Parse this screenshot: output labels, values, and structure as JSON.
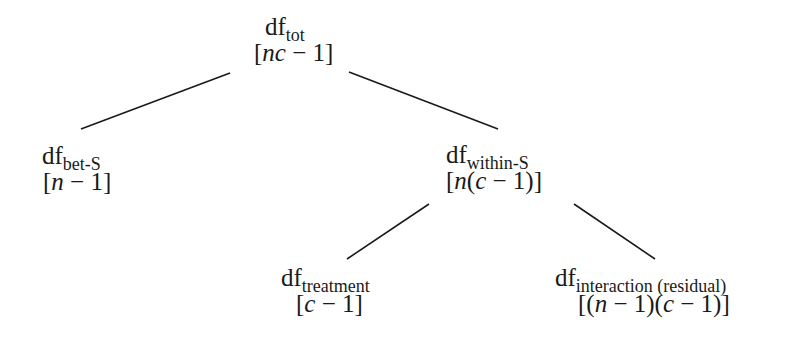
{
  "diagram": {
    "type": "tree",
    "nodes": {
      "total": {
        "base": "df",
        "subscript": "tot",
        "formula_parts": [
          "[",
          "nc",
          " − 1]"
        ]
      },
      "between_subjects": {
        "base": "df",
        "subscript": "bet-S",
        "formula_parts": [
          "[",
          "n",
          " − 1]"
        ]
      },
      "within_subjects": {
        "base": "df",
        "subscript": "within-S",
        "formula_parts": [
          "[",
          "n",
          "(",
          "c",
          " − 1)]"
        ]
      },
      "treatment": {
        "base": "df",
        "subscript": "treatment",
        "formula_parts": [
          "[",
          "c",
          " − 1]"
        ]
      },
      "interaction": {
        "base": "df",
        "subscript": "interaction (residual)",
        "formula_parts": [
          "[(",
          "n",
          " − 1)(",
          "c",
          " − 1)]"
        ]
      }
    },
    "edges": [
      {
        "from": "total",
        "to": "between_subjects",
        "x1": 230,
        "y1": 73,
        "x2": 81,
        "y2": 129
      },
      {
        "from": "total",
        "to": "within_subjects",
        "x1": 349,
        "y1": 72,
        "x2": 498,
        "y2": 129
      },
      {
        "from": "within_subjects",
        "to": "treatment",
        "x1": 429,
        "y1": 204,
        "x2": 347,
        "y2": 259
      },
      {
        "from": "within_subjects",
        "to": "interaction",
        "x1": 574,
        "y1": 204,
        "x2": 655,
        "y2": 259
      }
    ],
    "line_color": "#1a1a1a",
    "text_color": "#1a1a1a",
    "background": "#ffffff"
  }
}
